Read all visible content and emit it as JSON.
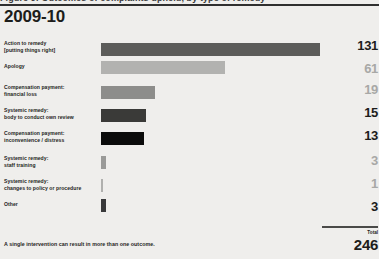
{
  "figure": {
    "caption_cutoff": "Figure 9: Outcomes of complaints upheld, by type of remedy",
    "title": "2009-10",
    "footnote": "A single intervention can result in more than one outcome.",
    "total_label": "Total",
    "total_value": "246"
  },
  "colors": {
    "background": "#efeeec",
    "title": "#1d1d1b",
    "value_strong": "#1d1d1b",
    "value_muted": "#a8a8a6",
    "rule": "#2f2f2f"
  },
  "chart_data": {
    "type": "bar",
    "orientation": "horizontal",
    "title": "2009-10",
    "xlabel": "",
    "ylabel": "",
    "grid": false,
    "legend": "none",
    "xlim": [
      0,
      131
    ],
    "note": "A single intervention can result in more than one outcome.",
    "total": 246,
    "categories": [
      "Action to remedy [putting things right]",
      "Apology",
      "Compensation payment: financial loss",
      "Systemic remedy: body to conduct own review",
      "Compensation payment: inconvenience / distress",
      "Systemic remedy: staff training",
      "Systemic remedy: changes to policy or procedure",
      "Other"
    ],
    "values": [
      131,
      61,
      19,
      15,
      13,
      3,
      1,
      3
    ],
    "bar_colors": [
      "#5c5c5a",
      "#b2b2b0",
      "#8d8d8b",
      "#3a3a38",
      "#0b0b0b",
      "#9a9a98",
      "#b0b0ae",
      "#39393a"
    ]
  },
  "rows": [
    {
      "label_line1": "Action to remedy",
      "label_line2": "[putting things right]",
      "value": "131",
      "value_muted": false,
      "bar_width": 219,
      "bar_color": "#5c5c5a",
      "top": 7,
      "bar_top": 3
    },
    {
      "label_line1": "Apology",
      "label_line2": "",
      "value": "61",
      "value_muted": true,
      "bar_width": 124,
      "bar_color": "#b2b2b0",
      "top": 30,
      "bar_top": -2
    },
    {
      "label_line1": "Compensation payment:",
      "label_line2": "financial loss",
      "value": "19",
      "value_muted": true,
      "bar_width": 54,
      "bar_color": "#8d8d8b",
      "top": 51,
      "bar_top": 2
    },
    {
      "label_line1": "Systemic remedy:",
      "label_line2": "body to conduct own review",
      "value": "15",
      "value_muted": false,
      "bar_width": 45,
      "bar_color": "#3a3a38",
      "top": 74,
      "bar_top": 2
    },
    {
      "label_line1": "Compensation payment:",
      "label_line2": "inconvenience / distress",
      "value": "13",
      "value_muted": false,
      "bar_width": 43,
      "bar_color": "#0b0b0b",
      "top": 97,
      "bar_top": 2
    },
    {
      "label_line1": "Systemic remedy:",
      "label_line2": "staff training",
      "value": "3",
      "value_muted": true,
      "bar_width": 5,
      "bar_color": "#9a9a98",
      "top": 122,
      "bar_top": 1
    },
    {
      "label_line1": "Systemic remedy:",
      "label_line2": "changes to policy or procedure",
      "value": "1",
      "value_muted": true,
      "bar_width": 2,
      "bar_color": "#b0b0ae",
      "top": 145,
      "bar_top": 1
    },
    {
      "label_line1": "Other",
      "label_line2": "",
      "value": "3",
      "value_muted": false,
      "bar_width": 5,
      "bar_color": "#39393a",
      "top": 168,
      "bar_top": -2
    }
  ]
}
